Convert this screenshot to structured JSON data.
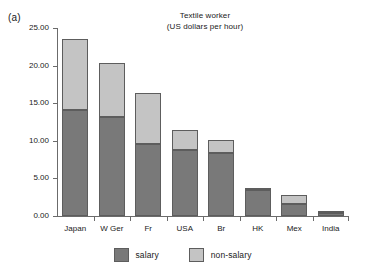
{
  "panel": {
    "label": "(a)"
  },
  "chart_data": {
    "type": "bar",
    "stacked": true,
    "title": "Textile worker",
    "subtitle": "(US dollars per hour)",
    "xlabel": "",
    "ylabel": "",
    "ylim": [
      0,
      25
    ],
    "yticks": [
      0,
      5,
      10,
      15,
      20,
      25
    ],
    "ytick_labels": [
      "0.00",
      "5.00",
      "10.00",
      "15.00",
      "20.00",
      "25.00"
    ],
    "grid": false,
    "legend_position": "bottom",
    "categories": [
      "Japan",
      "W Ger",
      "Fr",
      "USA",
      "Br",
      "HK",
      "Mex",
      "India"
    ],
    "series": [
      {
        "name": "salary",
        "color": "#797979",
        "values": [
          14.1,
          13.2,
          9.6,
          8.75,
          8.4,
          3.4,
          1.6,
          0.45
        ]
      },
      {
        "name": "non-salary",
        "color": "#c4c4c4",
        "values": [
          9.4,
          7.1,
          6.7,
          2.75,
          1.7,
          0.3,
          1.2,
          0.05
        ]
      }
    ],
    "totals": [
      23.5,
      20.3,
      16.3,
      11.5,
      10.1,
      3.7,
      2.8,
      0.5
    ]
  },
  "legend": {
    "items": [
      {
        "label": "salary",
        "color": "#797979"
      },
      {
        "label": "non-salary",
        "color": "#c4c4c4"
      }
    ]
  },
  "colors": {
    "salary": "#797979",
    "non_salary": "#c4c4c4",
    "axis": "#6b6b6b",
    "bar_outline": "#5d5d5d",
    "background": "#ffffff",
    "text": "#1a1a1a"
  }
}
